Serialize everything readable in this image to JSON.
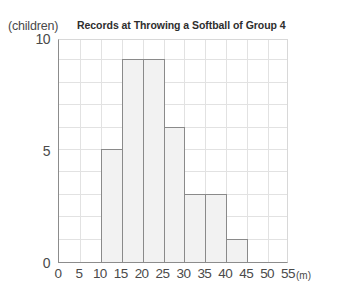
{
  "chart_data": {
    "type": "bar",
    "title": "Records at Throwing a Softball of Group 4",
    "xlabel": "(m)",
    "ylabel": "(children)",
    "categories": [
      "0-5",
      "5-10",
      "10-15",
      "15-20",
      "20-25",
      "25-30",
      "30-35",
      "35-40",
      "40-45",
      "45-50",
      "50-55"
    ],
    "bin_starts": [
      0,
      5,
      10,
      15,
      20,
      25,
      30,
      35,
      40,
      45,
      50
    ],
    "bin_width": 5,
    "values": [
      0,
      0,
      5,
      9,
      9,
      6,
      3,
      3,
      1,
      0,
      0
    ],
    "xlim": [
      0,
      55
    ],
    "ylim": [
      0,
      10
    ],
    "x_ticks": [
      "0",
      "5",
      "10",
      "15",
      "20",
      "25",
      "30",
      "35",
      "40",
      "45",
      "50",
      "55"
    ],
    "x_tick_values": [
      0,
      5,
      10,
      15,
      20,
      25,
      30,
      35,
      40,
      45,
      50,
      55
    ],
    "y_ticks": [
      "0",
      "5",
      "10"
    ],
    "y_tick_values": [
      0,
      5,
      10
    ],
    "y_gridline_step": 1,
    "grid": true,
    "legend": null,
    "bar_fill_color": "#f2f2f2",
    "bar_border_color": "#8a8a8a",
    "grid_color": "#e2e2e2",
    "axis_color": "#8c8c8c",
    "background_color": "#ffffff"
  }
}
